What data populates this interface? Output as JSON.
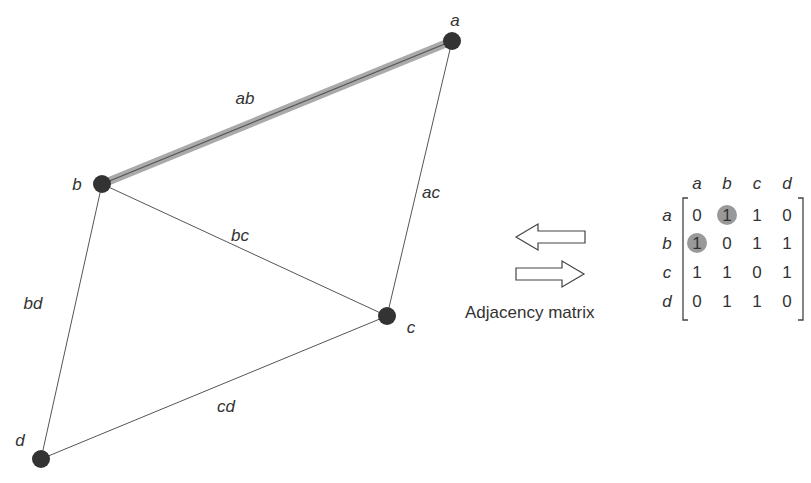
{
  "graph": {
    "nodes": [
      {
        "id": "a",
        "label": "a",
        "x": 452,
        "y": 41,
        "lx": 455,
        "ly": 26
      },
      {
        "id": "b",
        "label": "b",
        "x": 102,
        "y": 184,
        "lx": 77,
        "ly": 190
      },
      {
        "id": "c",
        "label": "c",
        "x": 387,
        "y": 316,
        "lx": 411,
        "ly": 333
      },
      {
        "id": "d",
        "label": "d",
        "x": 41,
        "y": 459,
        "lx": 20,
        "ly": 446
      }
    ],
    "edges": [
      {
        "id": "ab",
        "label": "ab",
        "from": "a",
        "to": "b",
        "highlighted": true,
        "lx": 245,
        "ly": 104
      },
      {
        "id": "ac",
        "label": "ac",
        "from": "a",
        "to": "c",
        "highlighted": false,
        "lx": 431,
        "ly": 198
      },
      {
        "id": "bc",
        "label": "bc",
        "from": "b",
        "to": "c",
        "highlighted": false,
        "lx": 240,
        "ly": 241
      },
      {
        "id": "bd",
        "label": "bd",
        "from": "b",
        "to": "d",
        "highlighted": false,
        "lx": 33,
        "ly": 309
      },
      {
        "id": "cd",
        "label": "cd",
        "from": "c",
        "to": "d",
        "highlighted": false,
        "lx": 226,
        "ly": 412
      }
    ]
  },
  "arrows": {
    "left": {
      "label": "left-arrow"
    },
    "right": {
      "label": "right-arrow"
    }
  },
  "caption": "Adjacency matrix",
  "matrix": {
    "col_headers": [
      "a",
      "b",
      "c",
      "d"
    ],
    "row_headers": [
      "a",
      "b",
      "c",
      "d"
    ],
    "values": [
      [
        0,
        1,
        1,
        0
      ],
      [
        1,
        0,
        1,
        1
      ],
      [
        1,
        1,
        0,
        1
      ],
      [
        0,
        1,
        1,
        0
      ]
    ],
    "highlighted_cells": [
      [
        0,
        1
      ],
      [
        1,
        0
      ]
    ]
  },
  "colors": {
    "node": "#333333",
    "edge": "#555555",
    "highlight_edge": "#aaaaaa",
    "highlight_cell": "#999999",
    "text": "#333333"
  }
}
